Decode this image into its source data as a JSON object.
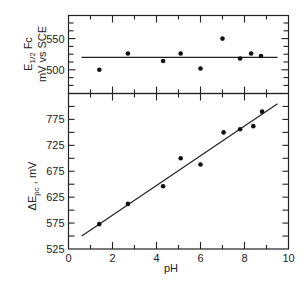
{
  "chart_data": [
    {
      "type": "scatter",
      "panel": "top",
      "title": "",
      "xlabel": "",
      "ylabel_line1": "E",
      "ylabel_sub": "1/2",
      "ylabel_suffix": " Fc",
      "ylabel_line2": "mV vs SCE",
      "ylabel": "E1/2 Fc mV vs SCE",
      "xlim": [
        0,
        10
      ],
      "ylim": [
        462,
        587
      ],
      "yticks_labeled": [
        500,
        550
      ],
      "yticks_minor_step": 25,
      "grid": false,
      "series": [
        {
          "name": "E1/2 Fc",
          "x": [
            1.4,
            2.7,
            4.3,
            5.1,
            6.0,
            7.0,
            7.8,
            8.3,
            8.75
          ],
          "y": [
            500,
            526,
            514,
            526,
            502,
            550,
            518,
            526,
            522
          ]
        }
      ],
      "fit_line": {
        "x": [
          0.6,
          9.5
        ],
        "y": [
          520,
          520
        ]
      }
    },
    {
      "type": "scatter",
      "panel": "bottom",
      "title": "",
      "xlabel": "pH",
      "ylabel": "ΔEpc , mV",
      "ylabel_delta": "ΔE",
      "ylabel_sub": "pc",
      "ylabel_suffix": " , mV",
      "xlim": [
        0,
        10
      ],
      "ylim": [
        525,
        825
      ],
      "xticks": [
        0,
        2,
        4,
        6,
        8,
        10
      ],
      "yticks_labeled": [
        525,
        575,
        625,
        675,
        725,
        775
      ],
      "grid": false,
      "series": [
        {
          "name": "ΔEpc",
          "x": [
            1.4,
            2.7,
            4.3,
            5.1,
            6.0,
            7.05,
            7.8,
            8.4,
            8.8
          ],
          "y": [
            573,
            612,
            646,
            700,
            688,
            750,
            756,
            762,
            790
          ]
        }
      ],
      "fit_line": {
        "x": [
          0.6,
          9.5
        ],
        "y": [
          550,
          805
        ]
      }
    }
  ],
  "axes": {
    "x_tick_labels": [
      "0",
      "2",
      "4",
      "6",
      "8",
      "10"
    ],
    "x_title": "pH",
    "top_y_tick_labels": [
      "550",
      "500"
    ],
    "bottom_y_tick_labels": [
      "775",
      "725",
      "675",
      "625",
      "575",
      "525"
    ]
  }
}
